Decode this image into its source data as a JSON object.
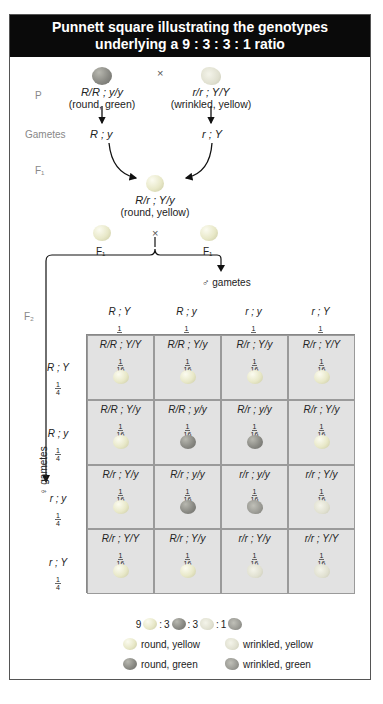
{
  "title": "Punnett square illustrating the genotypes underlying a 9 : 3 : 3 : 1 ratio",
  "title_lines": [
    "Punnett square illustrating the genotypes",
    "underlying a 9 : 3 : 3 : 1 ratio"
  ],
  "generations": {
    "p": "P",
    "gametes": "Gametes",
    "f1": "F₁",
    "f2": "F₂"
  },
  "cross_symbol": "×",
  "parents": {
    "left": {
      "genotype": "R/R ; y/y",
      "phenotype": "(round, green)",
      "gamete": "R ; y",
      "pea": "rg"
    },
    "right": {
      "genotype": "r/r ; Y/Y",
      "phenotype": "(wrinkled, yellow)",
      "gamete": "r ; Y",
      "pea": "wy"
    }
  },
  "f1": {
    "genotype": "R/r ; Y/y",
    "phenotype": "(round, yellow)",
    "left_label": "F₁",
    "right_label": "F₁"
  },
  "male_gametes_label": "♂ gametes",
  "female_gametes_label": "♀ gametes",
  "columns": [
    {
      "gamete": "R ; Y",
      "num": "1",
      "den": "4"
    },
    {
      "gamete": "R ; y",
      "num": "1",
      "den": "4"
    },
    {
      "gamete": "r ; y",
      "num": "1",
      "den": "4"
    },
    {
      "gamete": "r ; Y",
      "num": "1",
      "den": "4"
    }
  ],
  "rows": [
    {
      "gamete": "R ; Y",
      "num": "1",
      "den": "4"
    },
    {
      "gamete": "R ; y",
      "num": "1",
      "den": "4"
    },
    {
      "gamete": "r ; y",
      "num": "1",
      "den": "4"
    },
    {
      "gamete": "r ; Y",
      "num": "1",
      "den": "4"
    }
  ],
  "cells": [
    [
      {
        "g": "R/R ; Y/Y",
        "p": "ry"
      },
      {
        "g": "R/R ; Y/y",
        "p": "ry"
      },
      {
        "g": "R/r ; Y/y",
        "p": "ry"
      },
      {
        "g": "R/r ; Y/Y",
        "p": "ry"
      }
    ],
    [
      {
        "g": "R/R ; Y/y",
        "p": "ry"
      },
      {
        "g": "R/R ; y/y",
        "p": "rg"
      },
      {
        "g": "R/r ; y/y",
        "p": "rg"
      },
      {
        "g": "R/r ; Y/y",
        "p": "ry"
      }
    ],
    [
      {
        "g": "R/r ; Y/y",
        "p": "ry"
      },
      {
        "g": "R/r ; y/y",
        "p": "rg"
      },
      {
        "g": "r/r ; y/y",
        "p": "wg"
      },
      {
        "g": "r/r ; Y/y",
        "p": "wy"
      }
    ],
    [
      {
        "g": "R/r ; Y/Y",
        "p": "ry"
      },
      {
        "g": "R/r ; Y/y",
        "p": "ry"
      },
      {
        "g": "r/r ; Y/y",
        "p": "wy"
      },
      {
        "g": "r/r ; Y/Y",
        "p": "wy"
      }
    ]
  ],
  "cell_fraction": {
    "num": "1",
    "den": "16"
  },
  "ratio": {
    "a": "9",
    "b": "3",
    "c": "3",
    "d": "1",
    "sep": ":"
  },
  "legend": [
    {
      "pea": "ry",
      "label": "round, yellow"
    },
    {
      "pea": "wy",
      "label": "wrinkled, yellow"
    },
    {
      "pea": "rg",
      "label": "round, green"
    },
    {
      "pea": "wg",
      "label": "wrinkled, green"
    }
  ]
}
